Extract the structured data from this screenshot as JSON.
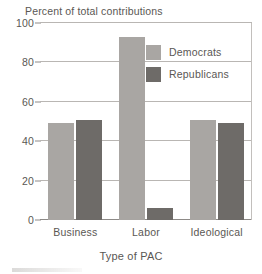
{
  "chart_data": {
    "type": "bar",
    "title": "",
    "ylabel": "Percent of total contributions",
    "xlabel": "Type of PAC",
    "categories": [
      "Business",
      "Labor",
      "Ideological"
    ],
    "series": [
      {
        "name": "Democrats",
        "color": "#a9a6a3",
        "values": [
          49,
          93,
          51
        ]
      },
      {
        "name": "Republicans",
        "color": "#6e6b68",
        "values": [
          51,
          6,
          49
        ]
      }
    ],
    "ylim": [
      0,
      100
    ],
    "yticks": [
      0,
      20,
      40,
      60,
      80,
      100
    ],
    "ytick_labels": [
      "0",
      "20",
      "40",
      "60",
      "80",
      "100"
    ],
    "grid": true,
    "legend_position": "upper right"
  },
  "legend": {
    "items": [
      {
        "label": "Democrats"
      },
      {
        "label": "Republicans"
      }
    ]
  },
  "axes": {
    "y_title": "Percent of total contributions",
    "x_title": "Type of PAC"
  }
}
